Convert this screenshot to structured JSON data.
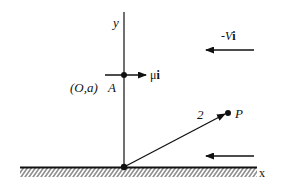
{
  "diagram": {
    "axes": {
      "x_label": "x",
      "y_label": "y"
    },
    "point_a": {
      "coord_label": "(O,a)",
      "name": "A"
    },
    "vortex_velocity": {
      "label_coef": "μ",
      "label_unit": "i"
    },
    "stream_velocity": {
      "label_coef": "-V",
      "label_unit": "i"
    },
    "position_vector": {
      "label": "2"
    },
    "point_p": {
      "name": "P"
    }
  }
}
